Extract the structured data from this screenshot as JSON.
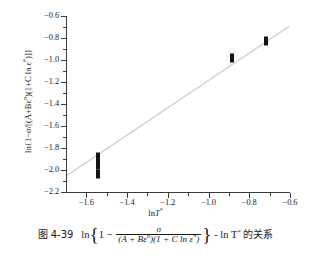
{
  "figure": {
    "caption_number": "图 4-39",
    "caption_prefix": "ln",
    "caption_inner_one": "1",
    "caption_minus": "−",
    "caption_numerator": "σ",
    "caption_denominator_left": "(A + Bε",
    "caption_denominator_exp": "n",
    "caption_denominator_mid": ")(1 + C ln ε̇",
    "caption_denominator_star": "*",
    "caption_denominator_right": ")",
    "caption_tail_lnT": "- ln T",
    "caption_tail_star": "*",
    "caption_suffix_cjk": "的关系"
  },
  "axes": {
    "y_title_parts": {
      "ln_open": "ln{1−σ/[(A+Bε",
      "exp_n": "n",
      "mid": ")(1+C ln ε̇",
      "star": "*",
      "close": ")]}"
    },
    "x_title": "lnT*",
    "x_title_ln": "ln",
    "x_title_T": "T",
    "x_title_star": "*"
  },
  "chart_data": {
    "type": "scatter",
    "title": "",
    "xlabel": "lnT*",
    "ylabel": "ln{1−σ/[(A+Bε^n)(1+C ln ε̇*)]}",
    "xlim": [
      -1.7,
      -0.6
    ],
    "ylim": [
      -2.2,
      -0.6
    ],
    "xticks": [
      -1.6,
      -1.4,
      -1.2,
      -1.0,
      -0.8,
      -0.6
    ],
    "xtick_labels": [
      "−1.6",
      "−1.4",
      "−1.2",
      "−1.0",
      "−0.8",
      "−0.6"
    ],
    "yticks": [
      -0.6,
      -0.8,
      -1.0,
      -1.2,
      -1.4,
      -1.6,
      -1.8,
      -2.0,
      -2.2
    ],
    "ytick_labels": [
      "−0.6",
      "−0.8",
      "−1.0",
      "−1.2",
      "−1.4",
      "−1.6",
      "−1.8",
      "−2.0",
      "−2.2"
    ],
    "x_minor_ticks": [
      -1.5,
      -1.3,
      -1.1,
      -0.9,
      -0.7
    ],
    "y_minor_ticks": [
      -0.7,
      -0.9,
      -1.1,
      -1.3,
      -1.5,
      -1.7,
      -1.9,
      -2.1
    ],
    "grid": false,
    "legend": null,
    "series": [
      {
        "name": "data",
        "marker": "filled-rectangle",
        "color": "#141414",
        "points": [
          {
            "x": -1.545,
            "y": -1.885
          },
          {
            "x": -1.545,
            "y": -1.955
          },
          {
            "x": -1.545,
            "y": -2.035
          },
          {
            "x": -0.885,
            "y": -0.985
          },
          {
            "x": -0.72,
            "y": -0.825
          }
        ]
      },
      {
        "name": "linear fit",
        "type": "line",
        "color": "#c9c9c9",
        "x_start": -1.7,
        "y_start": -2.055,
        "x_end": -0.605,
        "y_end": -0.695
      }
    ]
  }
}
